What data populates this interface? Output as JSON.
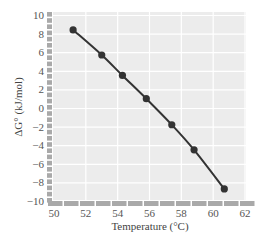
{
  "chart_data": {
    "type": "line",
    "title": "",
    "xlabel": "Temperature (°C)",
    "ylabel": "ΔG° (kJ/mol)",
    "xlim": [
      50,
      62
    ],
    "ylim": [
      -10,
      10
    ],
    "x_ticks": [
      50,
      52,
      54,
      56,
      58,
      60,
      62
    ],
    "y_ticks": [
      10,
      8,
      6,
      4,
      2,
      0,
      -2,
      -4,
      -6,
      -8,
      -10
    ],
    "grid": true,
    "legend": null,
    "series": [
      {
        "name": "ΔG°",
        "markers": true,
        "x": [
          51.2,
          53.0,
          54.3,
          55.8,
          57.4,
          58.8,
          60.7
        ],
        "values": [
          8.4,
          5.7,
          3.5,
          1.0,
          -1.8,
          -4.5,
          -8.7
        ]
      }
    ]
  },
  "colors": {
    "plot_background": "#ececec",
    "grid": "#ffffff",
    "axis_bar": "#a9a9a9",
    "line": "#333333",
    "marker": "#333333",
    "text": "#555555"
  },
  "labels": {
    "x_tick_labels": [
      "50",
      "52",
      "54",
      "56",
      "58",
      "60",
      "62"
    ],
    "y_tick_labels": [
      "10",
      "8",
      "6",
      "4",
      "2",
      "0",
      "−2",
      "−4",
      "−6",
      "−8",
      "−10"
    ],
    "xlabel": "Temperature (°C)",
    "ylabel": "ΔG° (kJ/mol)"
  }
}
